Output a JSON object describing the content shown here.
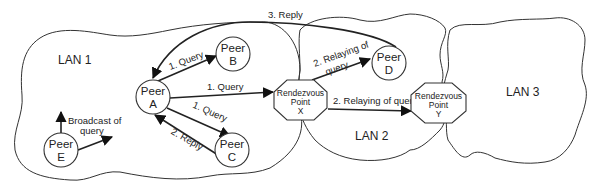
{
  "diagram": {
    "type": "network-diagram",
    "lans": [
      {
        "id": "lan1",
        "label": "LAN 1"
      },
      {
        "id": "lan2",
        "label": "LAN 2"
      },
      {
        "id": "lan3",
        "label": "LAN 3"
      }
    ],
    "peers": [
      {
        "id": "A",
        "line1": "Peer",
        "line2": "A"
      },
      {
        "id": "B",
        "line1": "Peer",
        "line2": "B"
      },
      {
        "id": "C",
        "line1": "Peer",
        "line2": "C"
      },
      {
        "id": "D",
        "line1": "Peer",
        "line2": "D"
      },
      {
        "id": "E",
        "line1": "Peer",
        "line2": "E"
      }
    ],
    "rendezvous": [
      {
        "id": "X",
        "line1": "Rendezvous",
        "line2": "Point",
        "line3": "X"
      },
      {
        "id": "Y",
        "line1": "Rendezvous",
        "line2": "Point",
        "line3": "Y"
      }
    ],
    "edges": [
      {
        "from": "A",
        "to": "B",
        "label": "1. Query"
      },
      {
        "from": "A",
        "to": "X",
        "label": "1. Query"
      },
      {
        "from": "A",
        "to": "C",
        "label": "1. Query"
      },
      {
        "from": "C",
        "to": "A",
        "label": "2. Reply"
      },
      {
        "from": "X",
        "to": "D",
        "label_line1": "2. Relaying of",
        "label_line2": "query"
      },
      {
        "from": "X",
        "to": "Y",
        "label": "2. Relaying of query"
      },
      {
        "from": "D",
        "to": "A",
        "label": "3. Reply"
      },
      {
        "from": "E",
        "to": "broadcast",
        "label_line1": "Broadcast of",
        "label_line2": "query"
      }
    ]
  }
}
